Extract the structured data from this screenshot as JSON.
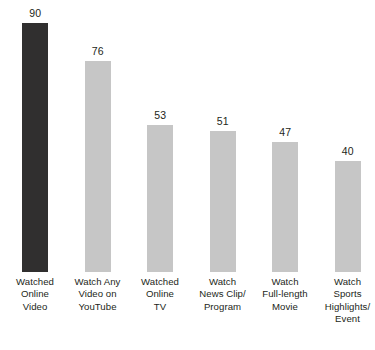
{
  "chart_data": {
    "type": "bar",
    "title": "",
    "subtitle": "",
    "xlabel": "",
    "ylabel": "",
    "ylim": [
      0,
      100
    ],
    "grid": false,
    "legend": null,
    "orientation": "vertical",
    "value_labels_shown": true,
    "categories": [
      "Watched Online Video",
      "Watch Any Video on YouTube",
      "Watched Online TV",
      "Watch News Clip/Program",
      "Watch Full-length Movie",
      "Watch Sports Highlights/Event"
    ],
    "category_label_lines": [
      [
        "Watched",
        "Online",
        "Video"
      ],
      [
        "Watch Any",
        "Video on",
        "YouTube"
      ],
      [
        "Watched",
        "Online",
        "TV"
      ],
      [
        "Watch",
        "News Clip/",
        "Program"
      ],
      [
        "Watch",
        "Full-length",
        "Movie"
      ],
      [
        "Watch",
        "Sports",
        "Highlights/",
        "Event"
      ]
    ],
    "values": [
      90,
      76,
      53,
      51,
      47,
      40
    ],
    "value_label_text": [
      "90",
      "76",
      "53",
      "51",
      "47",
      "40"
    ],
    "bar_colors": [
      "#302f2f",
      "#c6c6c6",
      "#c6c6c6",
      "#c6c6c6",
      "#c6c6c6",
      "#c6c6c6"
    ],
    "highlight_index": 0,
    "colors": {
      "background": "#ffffff",
      "highlight_bar": "#302f2f",
      "default_bar": "#c6c6c6",
      "text": "#231f20"
    }
  }
}
